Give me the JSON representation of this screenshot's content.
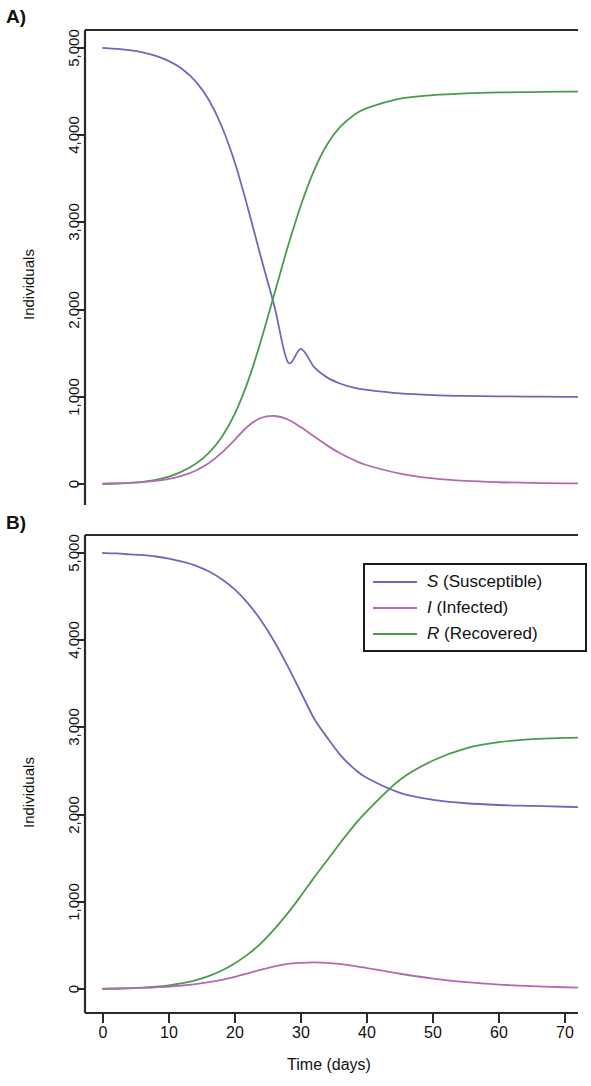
{
  "figure": {
    "panels": [
      {
        "id": "A",
        "label": "A)"
      },
      {
        "id": "B",
        "label": "B)"
      }
    ],
    "axis": {
      "ylabel": "Individuals",
      "xlabel": "Time (days)",
      "yticks": [
        "0",
        "1,000",
        "2,000",
        "3,000",
        "4,000",
        "5,000"
      ],
      "xticks": [
        "0",
        "10",
        "20",
        "30",
        "40",
        "50",
        "60",
        "70"
      ]
    },
    "legend": {
      "entries": [
        {
          "symbol": "S",
          "name": " (Susceptible)",
          "color": "#6a6ac0"
        },
        {
          "symbol": "I",
          "name": " (Infected)",
          "color": "#b36ab3"
        },
        {
          "symbol": "R",
          "name": " (Recovered)",
          "color": "#4d9a4d"
        }
      ]
    }
  },
  "chart_data": [
    {
      "type": "line",
      "panel": "A",
      "title": "A)",
      "xlabel": "Time (days)",
      "ylabel": "Individuals",
      "xlim": [
        0,
        73
      ],
      "ylim": [
        -90,
        5180
      ],
      "xticks": [
        0,
        10,
        20,
        30,
        40,
        50,
        60,
        70
      ],
      "yticks": [
        0,
        1000,
        2000,
        3000,
        4000,
        5000
      ],
      "grid": false,
      "legend": "none",
      "x": [
        0,
        2,
        4,
        6,
        8,
        10,
        12,
        14,
        16,
        18,
        20,
        22,
        24,
        26,
        28,
        30,
        32,
        34,
        36,
        38,
        40,
        45,
        50,
        55,
        60,
        65,
        70,
        73
      ],
      "series": [
        {
          "name": "S (Susceptible)",
          "color": "#6a6ac0",
          "values": [
            5000,
            4990,
            4975,
            4950,
            4910,
            4850,
            4760,
            4620,
            4410,
            4100,
            3680,
            3150,
            2580,
            2030,
            1400,
            1550,
            1340,
            1220,
            1150,
            1105,
            1080,
            1040,
            1020,
            1010,
            1005,
            1002,
            1000,
            1000
          ]
        },
        {
          "name": "I (Infected)",
          "color": "#b36ab3",
          "values": [
            5,
            8,
            13,
            22,
            36,
            58,
            95,
            152,
            238,
            360,
            510,
            665,
            760,
            780,
            740,
            650,
            545,
            440,
            350,
            275,
            215,
            120,
            65,
            35,
            20,
            12,
            8,
            6
          ]
        },
        {
          "name": "R (Recovered)",
          "color": "#4d9a4d",
          "values": [
            0,
            5,
            12,
            25,
            48,
            85,
            145,
            230,
            355,
            540,
            810,
            1185,
            1660,
            2190,
            2720,
            3200,
            3600,
            3900,
            4100,
            4230,
            4310,
            4420,
            4460,
            4480,
            4490,
            4495,
            4500,
            4500
          ]
        }
      ],
      "annotations": {
        "infected_peak": {
          "day": 27,
          "value": 780
        },
        "S_R_crossover": {
          "day": 29,
          "value": 2100
        },
        "S_final": 1000,
        "R_final": 4000,
        "S_initial": 5000
      }
    },
    {
      "type": "line",
      "panel": "B",
      "title": "B)",
      "xlabel": "Time (days)",
      "ylabel": "Individuals",
      "xlim": [
        0,
        73
      ],
      "ylim": [
        -90,
        5180
      ],
      "xticks": [
        0,
        10,
        20,
        30,
        40,
        50,
        60,
        70
      ],
      "yticks": [
        0,
        1000,
        2000,
        3000,
        4000,
        5000
      ],
      "grid": false,
      "legend": "top-right",
      "x": [
        0,
        2,
        4,
        6,
        8,
        10,
        12,
        14,
        16,
        18,
        20,
        22,
        24,
        26,
        28,
        30,
        32,
        34,
        36,
        38,
        40,
        45,
        50,
        55,
        60,
        65,
        70,
        73
      ],
      "series": [
        {
          "name": "S (Susceptible)",
          "color": "#6a6ac0",
          "values": [
            5000,
            4995,
            4985,
            4975,
            4960,
            4935,
            4900,
            4855,
            4790,
            4700,
            4580,
            4420,
            4220,
            3980,
            3700,
            3400,
            3100,
            2880,
            2680,
            2530,
            2420,
            2250,
            2170,
            2130,
            2110,
            2100,
            2090,
            2085
          ]
        },
        {
          "name": "I (Infected)",
          "color": "#b36ab3",
          "values": [
            5,
            7,
            10,
            14,
            20,
            28,
            40,
            56,
            78,
            106,
            140,
            180,
            222,
            260,
            288,
            300,
            305,
            300,
            285,
            265,
            240,
            175,
            120,
            78,
            50,
            32,
            20,
            15
          ]
        },
        {
          "name": "R (Recovered)",
          "color": "#4d9a4d",
          "values": [
            0,
            3,
            8,
            15,
            26,
            42,
            66,
            100,
            148,
            212,
            295,
            400,
            530,
            690,
            870,
            1070,
            1280,
            1480,
            1680,
            1870,
            2040,
            2400,
            2620,
            2760,
            2830,
            2865,
            2880,
            2885
          ]
        }
      ],
      "annotations": {
        "infected_peak": {
          "day": 34,
          "value": 305
        },
        "S_R_crossover": {
          "day": 47,
          "value": 2330
        },
        "S_final": 2090,
        "R_final": 2880,
        "S_initial": 5000
      }
    }
  ]
}
